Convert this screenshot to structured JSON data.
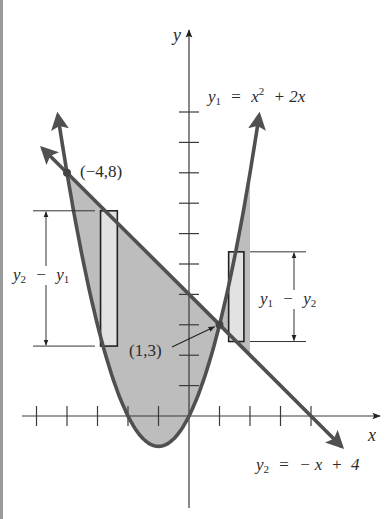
{
  "figure": {
    "colors": {
      "curve": "#505050",
      "axis": "#3a3a3a",
      "region_fill": "#bdbdbd",
      "rect_fill": "#e2e2e2",
      "rect_stroke": "#222222",
      "text": "#2a2a2a"
    },
    "axes": {
      "origin_px": [
        189,
        416
      ],
      "unit_px": [
        30.5,
        30.4
      ],
      "x_label": "x",
      "y_label": "y",
      "x_ticks": [
        -5,
        -4,
        -3,
        -2,
        -1,
        1,
        2,
        3,
        4
      ],
      "y_ticks": [
        1,
        2,
        3,
        4,
        5,
        6,
        7,
        8,
        9,
        10
      ]
    },
    "curves": {
      "parabola": {
        "name": "y1",
        "equation_lhs": "y",
        "equation_sub": "1",
        "equation_eq": "=",
        "equation_x": "x",
        "equation_sup": "2",
        "equation_rest": "+ 2x",
        "x_range": [
          -4.3,
          2.3
        ]
      },
      "line": {
        "name": "y2",
        "equation_lhs": "y",
        "equation_sub": "2",
        "equation_eq": "=",
        "equation_rest": "− x  +  4",
        "x_range": [
          -4.8,
          5.0
        ]
      }
    },
    "intersections": [
      {
        "label": "(−4,8)",
        "x": -4,
        "y": 8
      },
      {
        "label": "(1,3)",
        "x": 1,
        "y": 3
      }
    ],
    "regions": [
      {
        "name": "left-region",
        "x_from": -4,
        "x_to": 1,
        "top": "line",
        "bottom": "parabola"
      },
      {
        "name": "right-region",
        "x_from": 1,
        "x_to": 2,
        "top": "parabola",
        "bottom": "line"
      }
    ],
    "rectangles": [
      {
        "name": "left-rect",
        "x": -2.9,
        "width": 0.55,
        "y_top": 6.75,
        "y_bottom": 2.3,
        "dimension_label_a": "y",
        "dimension_sub_a": "2",
        "dimension_op": "−",
        "dimension_label_b": "y",
        "dimension_sub_b": "1"
      },
      {
        "name": "right-rect",
        "x": 1.3,
        "width": 0.5,
        "y_top": 5.4,
        "y_bottom": 2.45,
        "dimension_label_a": "y",
        "dimension_sub_a": "1",
        "dimension_op": "−",
        "dimension_label_b": "y",
        "dimension_sub_b": "2"
      }
    ]
  }
}
